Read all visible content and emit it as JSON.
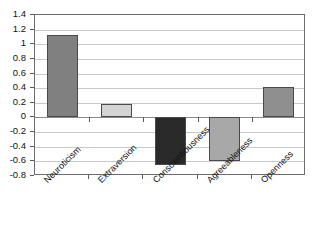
{
  "chart_data": {
    "type": "bar",
    "title": "",
    "subtitle": "",
    "xlabel": "",
    "ylabel": "",
    "categories": [
      "Neuroticism",
      "Extraversion",
      "Conscientiousness",
      "Agreeableness",
      "Openness"
    ],
    "values": [
      1.13,
      0.19,
      -0.65,
      -0.6,
      0.42
    ],
    "series": [
      {
        "name": "",
        "values": [
          1.13,
          0.19,
          -0.65,
          -0.6,
          0.42
        ]
      }
    ],
    "bar_colors": [
      "#808080",
      "#d4d4d4",
      "#2a2a2a",
      "#a8a8a8",
      "#8f8f8f"
    ],
    "bar_border_color": "#4a4a4a",
    "ylim": [
      -0.8,
      1.4
    ],
    "ytick_step": 0.2,
    "ytick_labels": [
      "1.4",
      "1.2",
      "1",
      "0.8",
      "0.6",
      "0.4",
      "0.2",
      "0",
      "-0.2",
      "-0.4",
      "-0.6",
      "-0.8"
    ],
    "ytick_values": [
      1.4,
      1.2,
      1.0,
      0.8,
      0.6,
      0.4,
      0.2,
      0,
      -0.2,
      -0.4,
      -0.6,
      -0.8
    ],
    "grid": true,
    "grid_axis": "y",
    "legend": false,
    "legend_position": "none",
    "zero_line": 0,
    "background_color": "#ffffff",
    "frame_color": "#6d6d6d",
    "gridline_color": "#c9c9c9"
  }
}
